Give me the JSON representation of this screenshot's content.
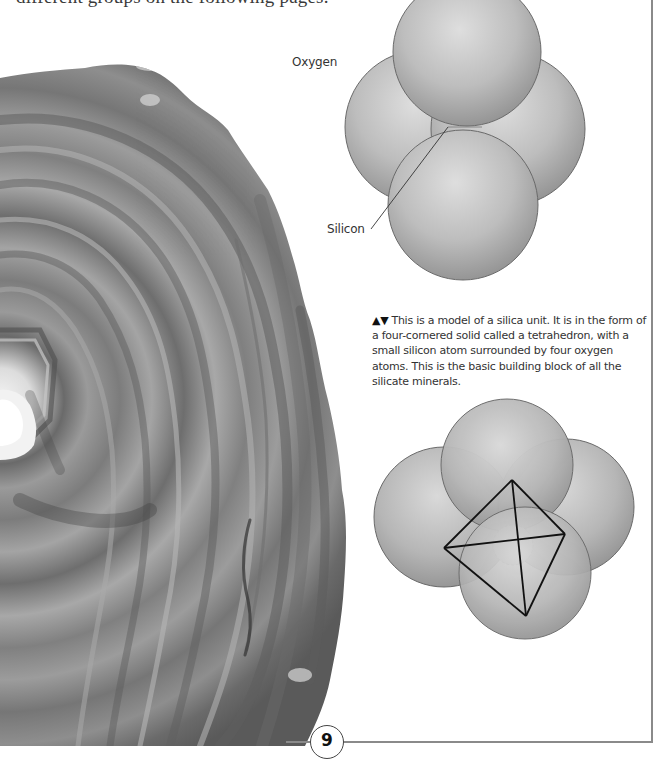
{
  "page": {
    "intro_text_fragment": "different groups on the following pages.",
    "page_number": "9"
  },
  "diagram_top": {
    "labels": {
      "oxygen": "Oxygen",
      "silicon": "Silicon"
    },
    "spheres": [
      {
        "name": "left-oxygen",
        "cx": 422,
        "cy": 127,
        "r": 77
      },
      {
        "name": "right-oxygen",
        "cx": 508,
        "cy": 127,
        "r": 77
      },
      {
        "name": "top-oxygen",
        "cx": 467,
        "cy": 55,
        "r": 74
      },
      {
        "name": "bottom-oxygen",
        "cx": 463,
        "cy": 205,
        "r": 75
      }
    ]
  },
  "caption": {
    "arrows": "▲▼",
    "text": "This is a model of a silica unit. It is in the form of a four-cornered solid called a tetrahedron, with a small silicon atom surrounded by four oxygen atoms. This is the basic building block of all the silicate minerals."
  },
  "diagram_bottom": {
    "spheres": [
      {
        "name": "left-oxygen",
        "cx": 444,
        "cy": 517,
        "r": 70
      },
      {
        "name": "right-oxygen",
        "cx": 566,
        "cy": 507,
        "r": 68
      },
      {
        "name": "top-oxygen",
        "cx": 507,
        "cy": 465,
        "r": 66
      },
      {
        "name": "bottom-oxygen",
        "cx": 525,
        "cy": 573,
        "r": 66
      }
    ],
    "tetrahedron_vertices": {
      "top": [
        512,
        480
      ],
      "left": [
        444,
        548
      ],
      "right": [
        565,
        534
      ],
      "bottom": [
        526,
        616
      ]
    },
    "silicon_atom": {
      "cx": 513,
      "cy": 545,
      "r": 20
    }
  },
  "colors": {
    "sphere_light": "#d6d6d6",
    "sphere_mid": "#b3b3b3",
    "sphere_dark": "#8f8f8f",
    "outline": "#555555",
    "agate_dark": "#555555",
    "agate_light": "#b8b8b8",
    "frame": "#8a8a8a"
  }
}
